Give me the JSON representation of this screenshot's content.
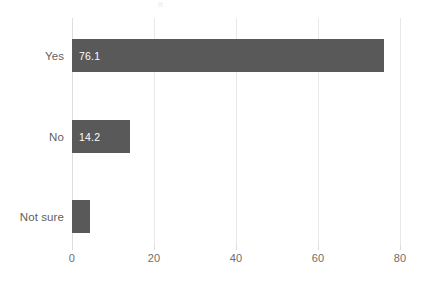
{
  "chart_data": {
    "type": "bar",
    "orientation": "horizontal",
    "title": "",
    "subtitle": "",
    "xlabel": "",
    "ylabel": "",
    "categories": [
      "Yes",
      "No",
      "Not sure"
    ],
    "values": [
      76.1,
      14.2,
      4.4
    ],
    "data_labels": [
      "76.1",
      "14.2",
      ""
    ],
    "series": [
      {
        "name": "",
        "values": [
          76.1,
          14.2,
          4.4
        ]
      }
    ],
    "xlim": [
      0,
      80
    ],
    "xticks": [
      0,
      20,
      40,
      60,
      80
    ],
    "xtick_labels": [
      "0",
      "20",
      "40",
      "60",
      "80"
    ],
    "grid": "vertical",
    "legend": "none",
    "bar_color": "#595959",
    "gridline_color": "#e8e8e8",
    "axis_color": "#dedede",
    "label_color": "#5f5f5f",
    "tick_label_color": "#6e6e6e",
    "data_label_color": "#ffffff",
    "background_color": "#ffffff"
  }
}
